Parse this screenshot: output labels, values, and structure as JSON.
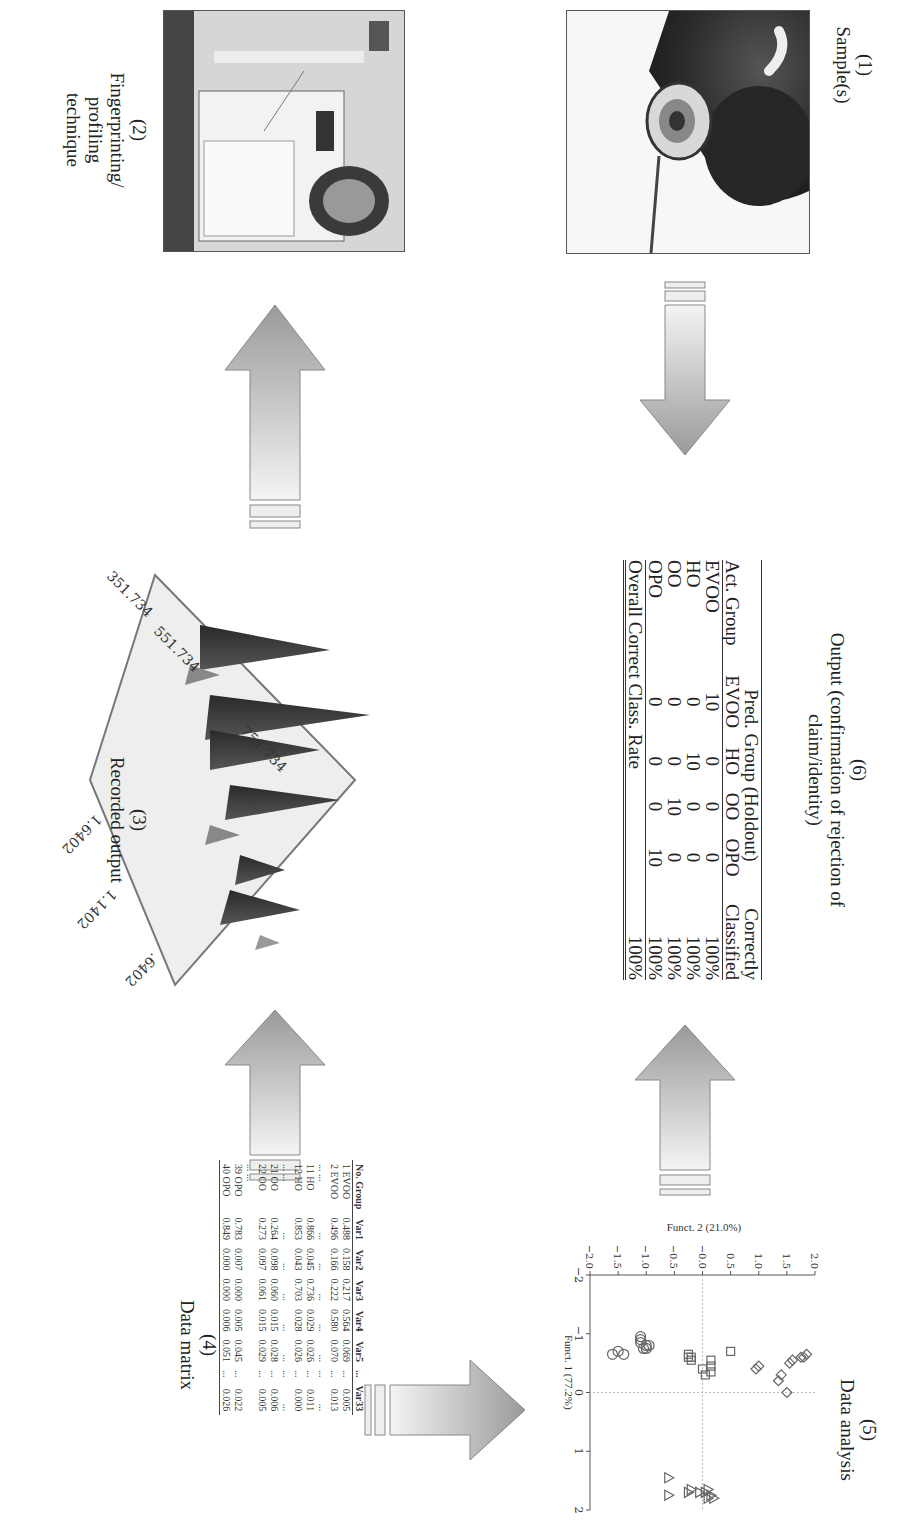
{
  "panels": {
    "p1": {
      "number": "(1)",
      "title": "Sample(s)"
    },
    "p2": {
      "number": "(2)",
      "title_lines": [
        "Fingerprinting/",
        "profiling",
        "technique"
      ]
    },
    "p3": {
      "number": "(3)",
      "title": "Recorded output",
      "axis_x_ticks": [
        "351.734",
        "551.734",
        "751.734"
      ],
      "axis_y_ticks": [
        ".6402",
        "1.1402",
        "1.6402"
      ]
    },
    "p4": {
      "number": "(4)",
      "title": "Data matrix"
    },
    "p5": {
      "number": "(5)",
      "title": "Data analysis"
    },
    "p6": {
      "number": "(6)",
      "title_lines": [
        "Output (confirmation of rejection of",
        "claim/identity)"
      ]
    }
  },
  "data_matrix": {
    "headers": [
      "No. Group",
      "Var1",
      "Var2",
      "Var3",
      "Var4",
      "Var5",
      "...",
      "Var33"
    ],
    "rows": [
      [
        "1 EVOO",
        "0.488",
        "0.158",
        "0.217",
        "0.564",
        "0.069",
        "...",
        "0.005"
      ],
      [
        "2 EVOO",
        "0.496",
        "0.166",
        "0.222",
        "0.580",
        "0.070",
        "...",
        "0.013"
      ],
      [
        "... ...",
        "...",
        "...",
        "...",
        "...",
        "...",
        "...",
        "..."
      ],
      [
        "11 HO",
        "0.866",
        "0.045",
        "0.736",
        "0.029",
        "0.026",
        "...",
        "0.011"
      ],
      [
        "12 HO",
        "0.853",
        "0.043",
        "0.703",
        "0.028",
        "0.026",
        "...",
        "0.000"
      ],
      [
        "... ...",
        "...",
        "...",
        "...",
        "...",
        "...",
        "...",
        "..."
      ],
      [
        "21 OO",
        "0.264",
        "0.098",
        "0.060",
        "0.015",
        "0.028",
        "...",
        "0.006"
      ],
      [
        "22 OO",
        "0.273",
        "0.097",
        "0.061",
        "0.015",
        "0.029",
        "...",
        "0.005"
      ],
      [
        "... ...",
        "",
        "",
        "",
        "",
        "",
        "",
        ""
      ],
      [
        "39 OPO",
        "0.783",
        "0.007",
        "0.000",
        "0.005",
        "0.045",
        "...",
        "0.022"
      ],
      [
        "40 OPO",
        "0.849",
        "0.000",
        "0.000",
        "0.006",
        "0.051",
        "...",
        "0.026"
      ]
    ]
  },
  "classification_table": {
    "group_header": "Pred. Group (Holdout)",
    "correct_header_lines": [
      "Correctly",
      "Classified"
    ],
    "columns": [
      "Act. Group",
      "EVOO",
      "HO",
      "OO",
      "OPO"
    ],
    "rows": [
      [
        "EVOO",
        "10",
        "0",
        "0",
        "0",
        "100%"
      ],
      [
        "HO",
        "0",
        "10",
        "0",
        "0",
        "100%"
      ],
      [
        "OO",
        "0",
        "0",
        "10",
        "0",
        "100%"
      ],
      [
        "OPO",
        "0",
        "0",
        "0",
        "10",
        "100%"
      ]
    ],
    "overall_label": "Overall Correct Class. Rate",
    "overall_value": "100%"
  },
  "chart_data": {
    "type": "scatter",
    "title": "Data analysis",
    "xlabel": "Funct. 1 (77.2%)",
    "ylabel": "Funct. 2 (21.0%)",
    "xlim": [
      -2,
      2
    ],
    "ylim": [
      -2.0,
      2.0
    ],
    "x_ticks": [
      "-2",
      "-1",
      "0",
      "1",
      "2"
    ],
    "y_ticks": [
      "-2.0",
      "-1.5",
      "-1.0",
      "-0.5",
      "-0.0",
      "0.5",
      "1.0",
      "1.5",
      "2.0"
    ],
    "grid": "reference lines at x=0 and y=0",
    "legend": "none (groups distinguished by marker shape)",
    "series": [
      {
        "name": "diamonds",
        "marker": "diamond",
        "points": [
          [
            0.0,
            1.5
          ],
          [
            -0.3,
            1.4
          ],
          [
            -0.2,
            1.35
          ],
          [
            -0.45,
            1.0
          ],
          [
            -0.4,
            0.95
          ],
          [
            -0.55,
            1.6
          ],
          [
            -0.5,
            1.55
          ],
          [
            -0.6,
            1.75
          ],
          [
            -0.65,
            1.85
          ],
          [
            -0.6,
            1.8
          ]
        ]
      },
      {
        "name": "squares",
        "marker": "square",
        "points": [
          [
            -0.3,
            0.05
          ],
          [
            -0.35,
            0.15
          ],
          [
            -0.45,
            0.15
          ],
          [
            -0.55,
            0.15
          ],
          [
            -0.55,
            -0.2
          ],
          [
            -0.6,
            -0.25
          ],
          [
            -0.65,
            -0.25
          ],
          [
            -0.7,
            0.5
          ],
          [
            -0.4,
            0.0
          ],
          [
            -0.6,
            -0.2
          ]
        ]
      },
      {
        "name": "circles",
        "marker": "circle",
        "points": [
          [
            -0.75,
            -1.05
          ],
          [
            -0.8,
            -1.0
          ],
          [
            -0.85,
            -1.1
          ],
          [
            -0.9,
            -1.1
          ],
          [
            -0.95,
            -1.1
          ],
          [
            -0.65,
            -1.4
          ],
          [
            -0.7,
            -1.5
          ],
          [
            -0.65,
            -1.6
          ],
          [
            -0.8,
            -0.95
          ],
          [
            -0.75,
            -1.0
          ]
        ]
      },
      {
        "name": "triangles",
        "marker": "triangle",
        "points": [
          [
            1.8,
            0.2
          ],
          [
            1.8,
            0.1
          ],
          [
            1.75,
            0.15
          ],
          [
            1.7,
            0.05
          ],
          [
            1.7,
            -0.05
          ],
          [
            1.65,
            0.1
          ],
          [
            1.7,
            -0.25
          ],
          [
            1.65,
            -0.2
          ],
          [
            1.75,
            -0.6
          ],
          [
            1.45,
            -0.6
          ]
        ]
      }
    ]
  }
}
